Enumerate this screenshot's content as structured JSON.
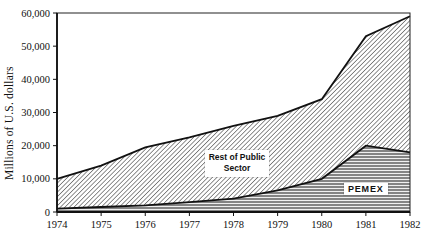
{
  "chart_data": {
    "type": "area",
    "stacked": true,
    "title": "",
    "xlabel": "",
    "ylabel": "Millions of U.S. dollars",
    "x": [
      1974,
      1975,
      1976,
      1977,
      1978,
      1979,
      1980,
      1981,
      1982
    ],
    "xtick_labels": [
      "1974",
      "1975",
      "1976",
      "1977",
      "1978",
      "1979",
      "1980",
      "1981",
      "1982"
    ],
    "ylim": [
      0,
      60000
    ],
    "yticks": [
      0,
      10000,
      20000,
      30000,
      40000,
      50000,
      60000
    ],
    "ytick_labels": [
      "0",
      "10,000",
      "20,000",
      "30,000",
      "40,000",
      "50,000",
      "60,000"
    ],
    "grid": false,
    "legend": "inline-labels",
    "series": [
      {
        "name": "PEMEX",
        "label": "PEMEX",
        "pattern": "horizontal-lines",
        "values": [
          1000,
          1500,
          2000,
          3000,
          4000,
          6500,
          10000,
          20000,
          18000
        ]
      },
      {
        "name": "Rest of Public Sector",
        "label": "Rest of Public Sector",
        "pattern": "diagonal-hatch",
        "values": [
          9000,
          12500,
          17500,
          19500,
          22000,
          22500,
          24000,
          33000,
          41000
        ]
      }
    ],
    "stacked_totals": [
      10000,
      14000,
      19500,
      22500,
      26000,
      29000,
      34000,
      53000,
      59000
    ],
    "colors": {
      "ink": "#111111",
      "background": "#ffffff",
      "hatch_line": "#3d3d3d",
      "stripe_line": "#4a4a4a"
    }
  }
}
